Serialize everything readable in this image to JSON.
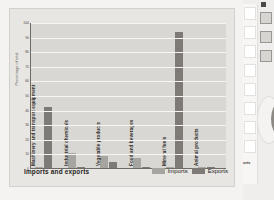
{
  "chart_data": {
    "type": "bar",
    "title": "Imports and exports",
    "xlabel": "",
    "ylabel": "Percentage of total",
    "ylim": [
      0,
      100
    ],
    "yticks": [
      0,
      10,
      20,
      30,
      40,
      50,
      60,
      70,
      80,
      90,
      100
    ],
    "ytick_labels": [
      "0",
      "10",
      "20",
      "30",
      "40",
      "50",
      "60",
      "70",
      "80",
      "90",
      "100"
    ],
    "grid": true,
    "legend_position": "bottom-right",
    "categories": [
      "Machinery and transport equipment",
      "Industrial chemicals",
      "Vegetable products",
      "Food and beverages",
      "Mineral fuels",
      "Animal products"
    ],
    "series": [
      {
        "name": "Imports",
        "color": "#a7a5a0",
        "values": [
          1,
          10,
          8,
          7,
          1,
          1
        ]
      },
      {
        "name": "Exports",
        "color": "#7e7b76",
        "values": [
          42,
          1,
          4,
          1,
          93,
          1
        ]
      }
    ]
  },
  "footer": {
    "title": "Imports and exports",
    "legend": [
      {
        "label": "Imports"
      },
      {
        "label": "Exports"
      }
    ]
  },
  "sidebar": {
    "caption": "orts",
    "slots": [
      "",
      "",
      "",
      "",
      "",
      "",
      "",
      ""
    ],
    "thumbs": [
      "",
      "",
      ""
    ]
  }
}
